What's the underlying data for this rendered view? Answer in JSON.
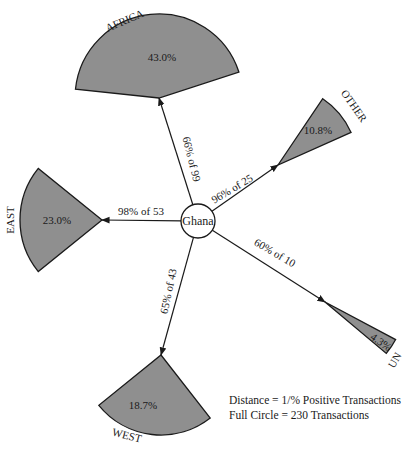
{
  "hub": {
    "label": "Ghana",
    "cx": 198,
    "cy": 221,
    "r": 17
  },
  "colors": {
    "sector_fill": "#8f8f8f",
    "stroke": "#1a1a1a",
    "background": "#ffffff"
  },
  "legend": {
    "line1": "Distance = 1/% Positive Transactions",
    "line2": "Full Circle = 230 Transactions"
  },
  "chart_data": {
    "type": "radial-sector-diagram",
    "center": "Ghana",
    "full_circle_transactions": 230,
    "distance_rule": "Distance = 1/% Positive Transactions",
    "regions": [
      {
        "name": "AFRICA",
        "share_label": "43.0%",
        "share": 43.0,
        "edge_label": "66% of 99",
        "positive_pct": 66,
        "transactions": 99
      },
      {
        "name": "OTHER",
        "share_label": "10.8%",
        "share": 10.8,
        "edge_label": "96% of 25",
        "positive_pct": 96,
        "transactions": 25
      },
      {
        "name": "EAST",
        "share_label": "23.0%",
        "share": 23.0,
        "edge_label": "98% of 53",
        "positive_pct": 98,
        "transactions": 53
      },
      {
        "name": "WEST",
        "share_label": "18.7%",
        "share": 18.7,
        "edge_label": "65% of 43",
        "positive_pct": 65,
        "transactions": 43
      },
      {
        "name": "UN",
        "share_label": "4.3%",
        "share": 4.3,
        "edge_label": "60% of 10",
        "positive_pct": 60,
        "transactions": 10
      }
    ]
  },
  "sectors": [
    {
      "id": "africa",
      "name": "AFRICA",
      "share_label": "43.0%",
      "edge_label": "66% of 99",
      "vx": 159,
      "vy": 98,
      "radius": 84,
      "a1": 186,
      "a2": 342,
      "share_pos": [
        162,
        61
      ],
      "share_rot": 0,
      "name_pos": [
        126,
        24
      ],
      "name_rot": -23,
      "edge_pos": [
        188,
        160
      ],
      "edge_rot": 76
    },
    {
      "id": "other",
      "name": "OTHER",
      "share_label": "10.8%",
      "edge_label": "96% of 25",
      "vx": 278,
      "vy": 165,
      "radius": 80,
      "a1": 304,
      "a2": 336,
      "share_pos": [
        318,
        134
      ],
      "share_rot": 0,
      "name_pos": [
        351,
        108
      ],
      "name_rot": 55,
      "edge_pos": [
        234,
        192
      ],
      "edge_rot": -31
    },
    {
      "id": "east",
      "name": "EAST",
      "share_label": "23.0%",
      "edge_label": "98% of 53",
      "vx": 102,
      "vy": 220,
      "radius": 82,
      "a1": 141,
      "a2": 219,
      "share_pos": [
        57,
        224
      ],
      "share_rot": 0,
      "name_pos": [
        14,
        220
      ],
      "name_rot": -90,
      "edge_pos": [
        141,
        215
      ],
      "edge_rot": 0
    },
    {
      "id": "west",
      "name": "WEST",
      "share_label": "18.7%",
      "edge_label": "65% of 43",
      "vx": 161,
      "vy": 355,
      "radius": 80,
      "a1": 52,
      "a2": 141,
      "share_pos": [
        143,
        409
      ],
      "share_rot": 0,
      "name_pos": [
        126,
        439
      ],
      "name_rot": 14,
      "edge_pos": [
        172,
        292
      ],
      "edge_rot": -78
    },
    {
      "id": "un",
      "name": "UN",
      "share_label": "4.3%",
      "edge_label": "60% of 10",
      "vx": 325,
      "vy": 302,
      "radius": 80,
      "a1": 28,
      "a2": 40,
      "share_pos": [
        379,
        345
      ],
      "share_rot": 35,
      "name_pos": [
        398,
        362
      ],
      "name_rot": -60,
      "edge_pos": [
        273,
        256
      ],
      "edge_rot": 30
    }
  ]
}
